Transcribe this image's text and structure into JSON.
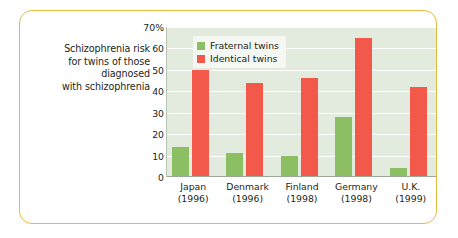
{
  "caption": {
    "lines": [
      "Schizophrenia risk",
      "for twins of those",
      "diagnosed",
      "with schizophrenia"
    ]
  },
  "colors": {
    "frame": "#e8b93f",
    "plot_background": "#e3ebde",
    "fraternal": "#8cbf63",
    "identical": "#f2594b",
    "gridline": "#ffffff",
    "axis": "#9aa896",
    "text": "#231f20"
  },
  "legend": {
    "position": "top-left-inside-plot",
    "entries": [
      {
        "label": "Fraternal twins",
        "color": "#8cbf63",
        "swatch": "legend-swatch-fraternal"
      },
      {
        "label": "Identical twins",
        "color": "#f2594b",
        "swatch": "legend-swatch-identical"
      }
    ]
  },
  "y_axis": {
    "ticks": [
      {
        "label": "70%",
        "value": 70
      },
      {
        "label": "60",
        "value": 60
      },
      {
        "label": "50",
        "value": 50
      },
      {
        "label": "40",
        "value": 40
      },
      {
        "label": "30",
        "value": 30
      },
      {
        "label": "20",
        "value": 20
      },
      {
        "label": "10",
        "value": 10
      },
      {
        "label": "0",
        "value": 0
      }
    ]
  },
  "x_axis": {
    "categories": [
      {
        "country": "Japan",
        "year": "(1996)"
      },
      {
        "country": "Denmark",
        "year": "(1996)"
      },
      {
        "country": "Finland",
        "year": "(1998)"
      },
      {
        "country": "Germany",
        "year": "(1998)"
      },
      {
        "country": "U.K.",
        "year": "(1999)"
      }
    ]
  },
  "chart_data": {
    "type": "bar",
    "title": "Schizophrenia risk for twins of those diagnosed with schizophrenia",
    "xlabel": "",
    "ylabel": "",
    "ylim": [
      0,
      70
    ],
    "ytick_interval": 10,
    "ytick_labels": [
      "0",
      "10",
      "20",
      "30",
      "40",
      "50",
      "60",
      "70%"
    ],
    "grid": true,
    "grid_axis": "y",
    "legend_position": "upper left",
    "unit": "percent",
    "categories": [
      "Japan (1996)",
      "Denmark (1996)",
      "Finland (1998)",
      "Germany (1998)",
      "U.K. (1999)"
    ],
    "series": [
      {
        "name": "Fraternal twins",
        "color": "#8cbf63",
        "values": [
          14,
          11,
          10,
          28,
          4
        ]
      },
      {
        "name": "Identical twins",
        "color": "#f2594b",
        "values": [
          50,
          44,
          46,
          65,
          42
        ]
      }
    ]
  }
}
